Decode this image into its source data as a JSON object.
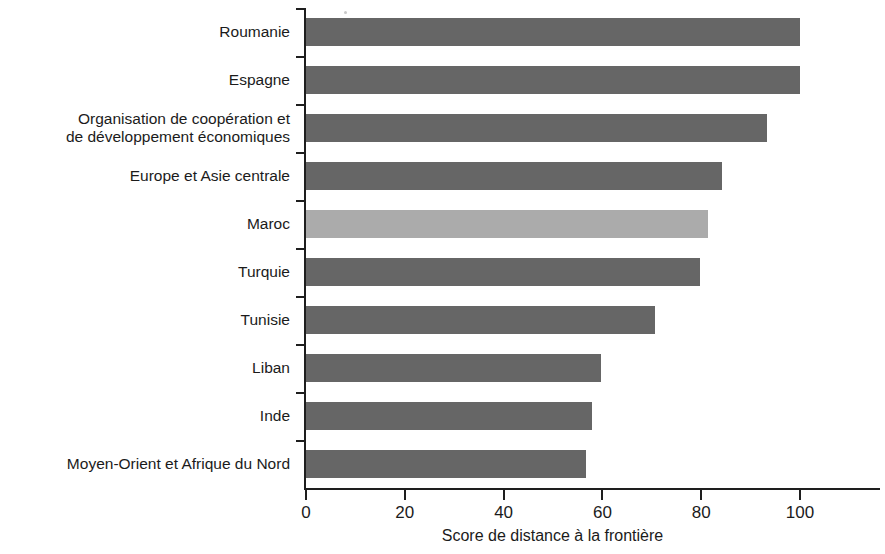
{
  "chart_data": {
    "type": "bar",
    "orientation": "horizontal",
    "title": "",
    "xlabel": "Score de distance à la frontière",
    "ylabel": "",
    "xlim": [
      0,
      100
    ],
    "xticks": [
      0,
      20,
      40,
      60,
      80,
      100
    ],
    "xtick_labels": [
      "0",
      "20",
      "40",
      "60",
      "80",
      "100"
    ],
    "grid": false,
    "legend": false,
    "categories": [
      "Roumanie",
      "Espagne",
      "Organisation de coopération et\nde développement économiques",
      "Europe et Asie centrale",
      "Maroc",
      "Turquie",
      "Tunisie",
      "Liban",
      "Inde",
      "Moyen-Orient et Afrique du Nord"
    ],
    "values": [
      100,
      100,
      93.3,
      84.2,
      81.4,
      79.8,
      70.7,
      59.8,
      57.8,
      56.6
    ],
    "bar_colors": [
      "#666666",
      "#666666",
      "#666666",
      "#666666",
      "#ababab",
      "#666666",
      "#666666",
      "#666666",
      "#666666",
      "#666666"
    ],
    "highlight_category": "Maroc",
    "colors": {
      "bar_default": "#666666",
      "bar_highlight": "#ababab",
      "axis": "#1e1e1e",
      "text": "#1b1b1b",
      "background": "#ffffff"
    }
  },
  "axis_title": {
    "text": "Score de distance à la frontière"
  }
}
